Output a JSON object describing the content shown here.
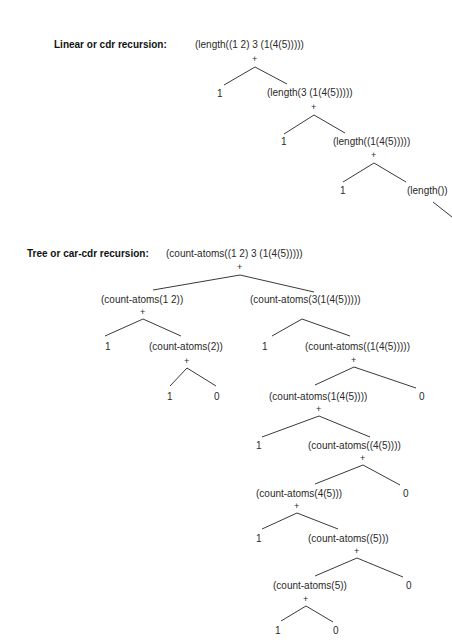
{
  "linear": {
    "heading": "Linear or cdr recursion:",
    "nodes": {
      "root": "(length((1 2) 3 (1(4(5)))))",
      "n1_left": "1",
      "n1_right": "(length(3 (1(4(5)))))",
      "n2_left": "1",
      "n2_right": "(length((1(4(5)))))",
      "n3_left": "1",
      "n3_right": "(length())"
    },
    "operator": "+"
  },
  "tree": {
    "heading": "Tree or car-cdr recursion:",
    "nodes": {
      "root": "(count-atoms((1 2) 3 (1(4(5)))))",
      "a": "(count-atoms(1 2))",
      "a_left": "1",
      "a_right": "(count-atoms(2))",
      "a_right_left": "1",
      "a_right_right": "0",
      "b": "(count-atoms(3(1(4(5)))))",
      "b_left": "1",
      "b_right": "(count-atoms((1(4(5)))))",
      "c": "(count-atoms(1(4(5))))",
      "c_sibling": "0",
      "c_left": "1",
      "c_right": "(count-atoms((4(5))))",
      "d": "(count-atoms(4(5)))",
      "d_sibling": "0",
      "d_left": "1",
      "d_right": "(count-atoms((5)))",
      "e": "(count-atoms(5))",
      "e_sibling": "0",
      "e_left": "1",
      "e_right": "0"
    },
    "operator": "+"
  }
}
